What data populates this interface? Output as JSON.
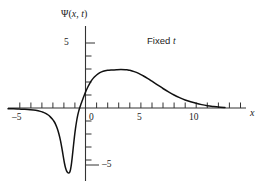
{
  "figure": {
    "name": "wave-function-fixed-time-plot",
    "background_color": "#ffffff",
    "curve_color": "#111111",
    "axis_color": "#333333"
  },
  "labels": {
    "y_axis_title_psi": "Ψ(",
    "y_axis_title_x": "x",
    "y_axis_title_comma": ", ",
    "y_axis_title_t": "t",
    "y_axis_title_close": ")",
    "x_axis_title": "x",
    "annotation_fixed": "Fixed ",
    "annotation_t": "t",
    "y_tick_positive": "5",
    "y_tick_negative": "–5",
    "x_tick_negative_five": "–5",
    "x_tick_zero": "0",
    "x_tick_five": "5",
    "x_tick_ten": "10"
  },
  "chart_data": {
    "type": "line",
    "title": "",
    "subtitle": "",
    "xlabel": "x",
    "ylabel": "Ψ(x, t)",
    "annotations": [
      {
        "text": "Fixed t",
        "x": 6.6,
        "y": 4.2
      }
    ],
    "xlim": [
      -7.0,
      14.2
    ],
    "ylim": [
      -6.6,
      6.2
    ],
    "grid": false,
    "legend": null,
    "x_ticks": [
      -6,
      -5,
      -4,
      -3,
      -2,
      -1,
      0,
      1,
      2,
      3,
      4,
      5,
      6,
      7,
      8,
      9,
      10,
      11,
      12,
      13
    ],
    "x_tick_labels": [
      {
        "value": -5,
        "label": "–5"
      },
      {
        "value": 0,
        "label": "0"
      },
      {
        "value": 5,
        "label": "5"
      },
      {
        "value": 10,
        "label": "10"
      }
    ],
    "y_ticks": [
      -5,
      -4,
      -3,
      -2,
      -1,
      1,
      2,
      3,
      4,
      5
    ],
    "y_tick_labels": [
      {
        "value": 5,
        "label": "5"
      },
      {
        "value": -5,
        "label": "–5"
      }
    ],
    "series": [
      {
        "name": "Ψ(x, t)",
        "color": "#111111",
        "x": [
          -7.0,
          -6.5,
          -6.0,
          -5.5,
          -5.0,
          -4.5,
          -4.0,
          -3.8,
          -3.6,
          -3.4,
          -3.2,
          -3.0,
          -2.85,
          -2.7,
          -2.55,
          -2.4,
          -2.25,
          -2.1,
          -2.0,
          -1.9,
          -1.8,
          -1.7,
          -1.6,
          -1.5,
          -1.45,
          -1.4,
          -1.35,
          -1.3,
          -1.25,
          -1.2,
          -1.1,
          -1.0,
          -0.9,
          -0.8,
          -0.7,
          -0.6,
          -0.5,
          -0.4,
          -0.3,
          -0.2,
          -0.1,
          0.0,
          0.2,
          0.4,
          0.6,
          0.8,
          1.0,
          1.3,
          1.6,
          2.0,
          2.4,
          2.8,
          3.2,
          3.6,
          3.8,
          4.0,
          4.4,
          4.8,
          5.2,
          5.6,
          6.0,
          6.5,
          7.0,
          7.5,
          8.0,
          8.5,
          9.0,
          9.5,
          10.0,
          10.5,
          11.0,
          11.5,
          12.0,
          12.6
        ],
        "y": [
          -0.05,
          -0.06,
          -0.08,
          -0.1,
          -0.13,
          -0.18,
          -0.28,
          -0.34,
          -0.42,
          -0.52,
          -0.66,
          -0.84,
          -1.02,
          -1.26,
          -1.58,
          -2.0,
          -2.55,
          -3.25,
          -3.76,
          -4.25,
          -4.62,
          -4.86,
          -4.98,
          -5.0,
          -4.97,
          -4.88,
          -4.72,
          -4.48,
          -4.16,
          -3.8,
          -3.0,
          -2.22,
          -1.55,
          -1.0,
          -0.55,
          -0.2,
          0.08,
          0.32,
          0.55,
          0.78,
          1.0,
          1.22,
          1.6,
          1.92,
          2.18,
          2.38,
          2.54,
          2.72,
          2.83,
          2.9,
          2.93,
          2.95,
          2.96,
          2.95,
          2.93,
          2.9,
          2.8,
          2.66,
          2.48,
          2.28,
          2.06,
          1.78,
          1.5,
          1.24,
          1.0,
          0.8,
          0.62,
          0.48,
          0.36,
          0.26,
          0.18,
          0.12,
          0.07,
          0.04
        ]
      }
    ],
    "features": {
      "minimum": {
        "x": -1.5,
        "y": -5.0
      },
      "maximum": {
        "x": 3.4,
        "y": 2.96
      },
      "zero_crossing": {
        "x": -0.55,
        "y": 0
      }
    }
  }
}
